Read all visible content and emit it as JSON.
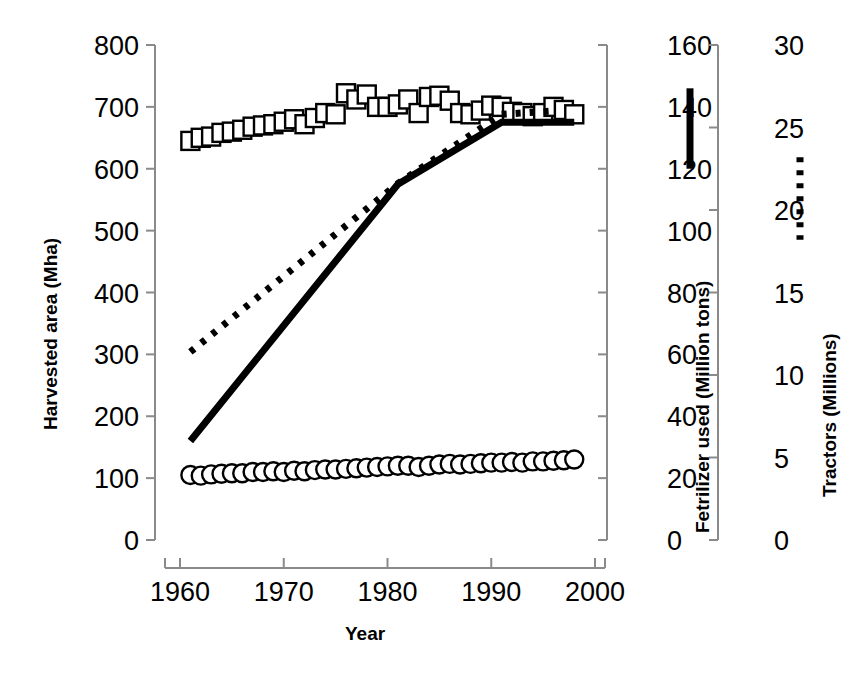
{
  "chart_data": {
    "type": "line",
    "title": "",
    "xlabel": "Year",
    "grid": false,
    "legend_position": "right-inline-vertical-markers",
    "x": [
      1961,
      1962,
      1963,
      1964,
      1965,
      1966,
      1967,
      1968,
      1969,
      1970,
      1971,
      1972,
      1973,
      1974,
      1975,
      1976,
      1977,
      1978,
      1979,
      1980,
      1981,
      1982,
      1983,
      1984,
      1985,
      1986,
      1987,
      1988,
      1989,
      1990,
      1991,
      1992,
      1993,
      1994,
      1995,
      1996,
      1997,
      1998
    ],
    "axes": [
      {
        "id": "left",
        "label": "Harvested area (Mha)",
        "ticks": [
          0,
          100,
          200,
          300,
          400,
          500,
          600,
          700,
          800
        ],
        "range": [
          0,
          800
        ]
      },
      {
        "id": "right-1",
        "label": "Fetrilizer used (Million tons)",
        "ticks": [
          0,
          20,
          40,
          60,
          80,
          100,
          120,
          140,
          160
        ],
        "range": [
          0,
          160
        ]
      },
      {
        "id": "right-2",
        "label": "Tractors (Millions)",
        "ticks": [
          0,
          5,
          10,
          15,
          20,
          25,
          30
        ],
        "range": [
          0,
          30
        ]
      }
    ],
    "xticks": [
      1960,
      1970,
      1980,
      1990,
      2000
    ],
    "xlim": [
      1958.5,
      2000
    ],
    "series": [
      {
        "name": "Cereal harvested area",
        "marker": "open-square",
        "axis": "left",
        "unit": "Mha",
        "values": [
          645,
          650,
          652,
          658,
          660,
          663,
          668,
          670,
          672,
          676,
          680,
          672,
          682,
          690,
          688,
          722,
          712,
          720,
          700,
          700,
          704,
          712,
          690,
          716,
          718,
          710,
          690,
          688,
          694,
          702,
          700,
          692,
          690,
          685,
          690,
          700,
          695,
          688
        ]
      },
      {
        "name": "Harvested area low series",
        "marker": "open-circle",
        "axis": "left",
        "unit": "Mha",
        "values": [
          105,
          104,
          106,
          107,
          108,
          108,
          110,
          110,
          111,
          110,
          112,
          111,
          113,
          114,
          114,
          115,
          116,
          117,
          118,
          119,
          120,
          120,
          118,
          120,
          122,
          123,
          122,
          123,
          124,
          125,
          125,
          126,
          125,
          127,
          127,
          128,
          129,
          130
        ]
      },
      {
        "name": "Fertilizer used",
        "marker": "solid-line",
        "axis": "right-1",
        "unit": "Million tons",
        "breakpoints_x": [
          1961,
          1981,
          1991,
          1998
        ],
        "breakpoints_y": [
          32,
          115,
          135,
          135
        ]
      },
      {
        "name": "Tractors",
        "marker": "dotted-line",
        "axis": "right-2",
        "unit": "Millions",
        "breakpoints_x": [
          1961,
          1981,
          1991,
          1996
        ],
        "breakpoints_y": [
          11.4,
          21.6,
          25.8,
          26.0
        ]
      }
    ],
    "legend_markers": [
      {
        "name": "fertilizer-legend",
        "style": "solid-bar",
        "axis": "right-1",
        "span": [
          120,
          146
        ]
      },
      {
        "name": "tractors-legend",
        "style": "dotted-bar",
        "axis": "right-2",
        "span": [
          18.2,
          23.2
        ]
      }
    ]
  },
  "labels": {
    "y_left": "Harvested area (Mha)",
    "y_right_1": "Fetrilizer used (Million tons)",
    "y_right_2": "Tractors (Millions)",
    "x": "Year"
  },
  "colors": {
    "ink": "#000000",
    "axis": "#8a8a8a",
    "background": "#ffffff"
  }
}
